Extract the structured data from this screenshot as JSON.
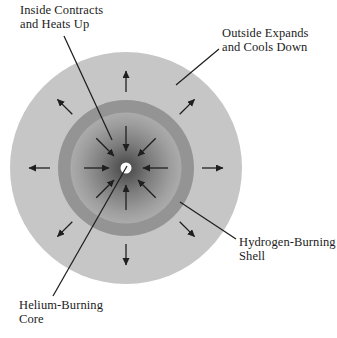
{
  "diagram": {
    "labels": {
      "inside_contracts": {
        "line1": "Inside Contracts",
        "line2": "and Heats Up"
      },
      "outside_expands": {
        "line1": "Outside Expands",
        "line2": "and Cools Down"
      },
      "hydrogen_shell": {
        "line1": "Hydrogen-Burning",
        "line2": "Shell"
      },
      "helium_core": {
        "line1": "Helium-Burning",
        "line2": "Core"
      }
    },
    "arrows": {
      "outward": {
        "directions": [
          "N",
          "NE",
          "E",
          "SE",
          "S",
          "SW",
          "W",
          "NW"
        ]
      },
      "inward": {
        "directions": [
          "N",
          "NE",
          "E",
          "SE",
          "S",
          "SW",
          "W",
          "NW"
        ]
      }
    },
    "colors": {
      "background": "#ffffff",
      "envelope": "#c6c6c6",
      "shell_ring": "#949494",
      "inner_edge": "#ababab",
      "inner_mid": "#7d7d7d",
      "inner_center": "#4a4a4a",
      "core_dot": "#ffffff",
      "line": "#1f1f1f"
    }
  }
}
